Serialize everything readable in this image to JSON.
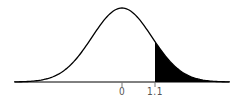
{
  "chart_data": {
    "type": "area",
    "title": "",
    "xlabel": "",
    "ylabel": "",
    "distribution": {
      "name": "standard normal",
      "mean": 0,
      "sd": 1
    },
    "x_ticks": [
      0,
      1.1
    ],
    "tick_labels": [
      "0",
      "1.1"
    ],
    "shaded_region": {
      "from": 1.1,
      "to": "infinity",
      "side": "right",
      "color": "#000000"
    },
    "xlim": [
      -3.6,
      3.6
    ],
    "grid": false,
    "legend": null
  },
  "colors": {
    "curve": "#000000",
    "fill": "#000000",
    "axis": "#000000",
    "label": "#555555"
  }
}
